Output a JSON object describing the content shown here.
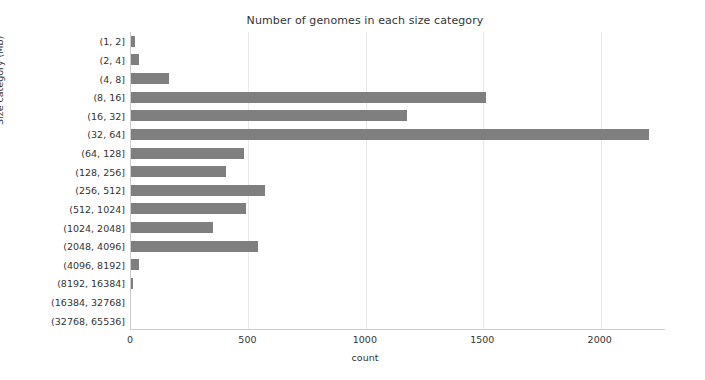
{
  "chart_data": {
    "type": "bar",
    "orientation": "horizontal",
    "title": "Number of genomes in each size category",
    "xlabel": "count",
    "ylabel": "Size category (Mb)",
    "categories": [
      "(1, 2]",
      "(2, 4]",
      "(4, 8]",
      "(8, 16]",
      "(16, 32]",
      "(32, 64]",
      "(64, 128]",
      "(128, 256]",
      "(256, 512]",
      "(512, 1024]",
      "(1024, 2048]",
      "(2048, 4096]",
      "(4096, 8192]",
      "(8192, 16384]",
      "(16384, 32768]",
      "(32768, 65536]"
    ],
    "values": [
      17,
      36,
      160,
      1510,
      1175,
      2205,
      480,
      405,
      570,
      490,
      350,
      540,
      35,
      8,
      0,
      0
    ],
    "xlim": [
      0,
      2278
    ],
    "ylim_categories": 16,
    "xticks": [
      0,
      500,
      1000,
      1500,
      2000
    ],
    "xtick_labels": [
      "0",
      "500",
      "1000",
      "1500",
      "2000"
    ],
    "grid": "vertical-only",
    "legend": "none",
    "bar_color": "#7f7f7f",
    "grid_color": "#e8e8e8",
    "axis_color": "#cccccc",
    "background_color": "#ffffff"
  }
}
